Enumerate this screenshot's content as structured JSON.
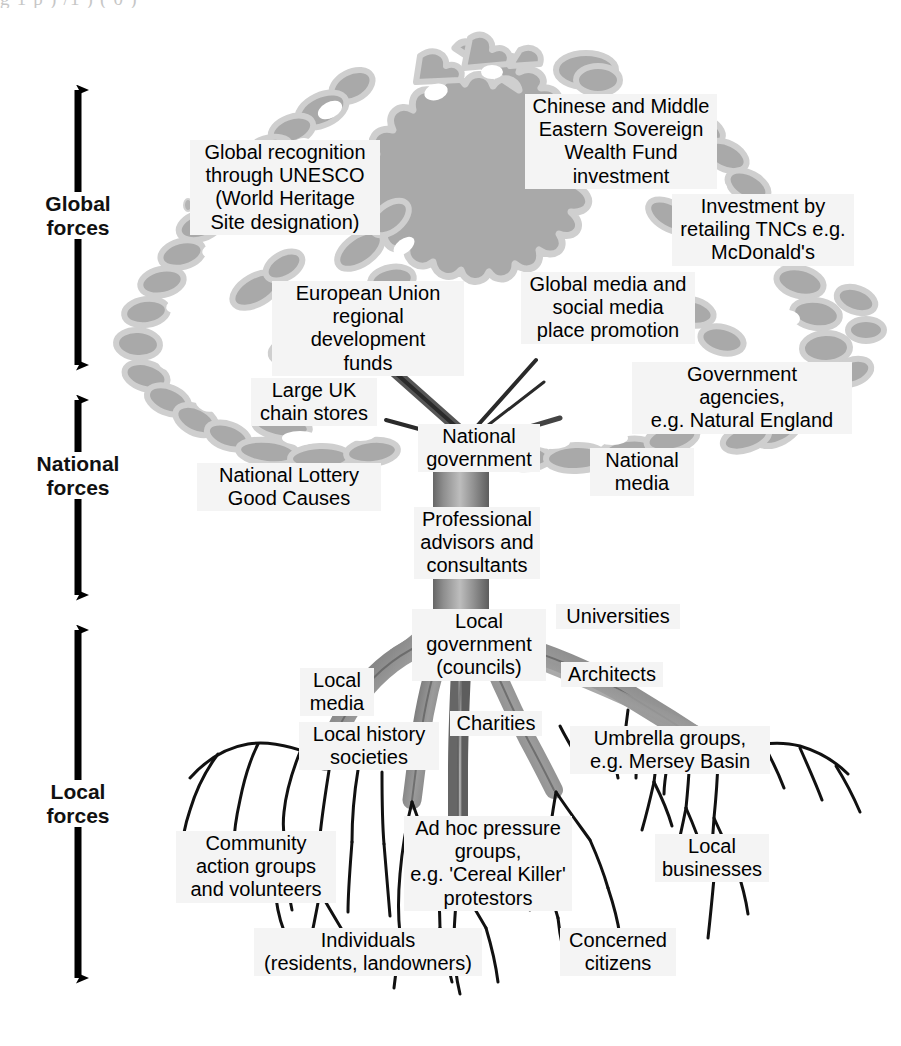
{
  "page": {
    "top_remnant_text": "g          1 p )       /1    )                (    0     )"
  },
  "colors": {
    "canopy_fill": "#a9a9a9",
    "canopy_outline": "#c9c9c9",
    "root_fill": "#8e8e8e",
    "root_outline": "#6f6f6f",
    "tendril": "#111111",
    "label_bg": "#f4f4f4",
    "arrow": "#000000",
    "page_bg": "#ffffff"
  },
  "axis": {
    "name": "forces-scale",
    "segments": [
      {
        "id": "global",
        "label": "Global\nforces"
      },
      {
        "id": "national",
        "label": "National\nforces"
      },
      {
        "id": "local",
        "label": "Local\nforces"
      }
    ]
  },
  "labels": {
    "global": [
      {
        "id": "unesco",
        "text": "Global recognition\nthrough UNESCO\n(World Heritage\nSite designation)"
      },
      {
        "id": "sovereign",
        "text": "Chinese and Middle\nEastern Sovereign\nWealth Fund\ninvestment"
      },
      {
        "id": "tnc",
        "text": "Investment by\nretailing TNCs e.g.\nMcDonald's"
      },
      {
        "id": "eu-funds",
        "text": "European Union\nregional development\nfunds"
      },
      {
        "id": "global-media",
        "text": "Global media and\nsocial media\nplace promotion"
      }
    ],
    "national": [
      {
        "id": "chain-stores",
        "text": "Large UK\nchain stores"
      },
      {
        "id": "lottery",
        "text": "National Lottery\nGood Causes"
      },
      {
        "id": "nat-government",
        "text": "National\ngovernment"
      },
      {
        "id": "gov-agencies",
        "text": "Government\nagencies,\ne.g. Natural England"
      },
      {
        "id": "nat-media",
        "text": "National\nmedia"
      },
      {
        "id": "advisors",
        "text": "Professional\nadvisors and\nconsultants"
      }
    ],
    "local": [
      {
        "id": "local-government",
        "text": "Local\ngovernment\n(councils)"
      },
      {
        "id": "universities",
        "text": "Universities"
      },
      {
        "id": "architects",
        "text": "Architects"
      },
      {
        "id": "local-media",
        "text": "Local\nmedia"
      },
      {
        "id": "charities",
        "text": "Charities"
      },
      {
        "id": "local-history",
        "text": "Local history\nsocieties"
      },
      {
        "id": "umbrella",
        "text": "Umbrella groups,\ne.g. Mersey Basin"
      },
      {
        "id": "community",
        "text": "Community\naction groups\nand volunteers"
      },
      {
        "id": "adhoc",
        "text": "Ad hoc pressure\ngroups,\ne.g. 'Cereal Killer'\nprotestors"
      },
      {
        "id": "local-business",
        "text": "Local\nbusinesses"
      },
      {
        "id": "individuals",
        "text": "Individuals\n(residents, landowners)"
      },
      {
        "id": "citizens",
        "text": "Concerned\ncitizens"
      }
    ]
  }
}
